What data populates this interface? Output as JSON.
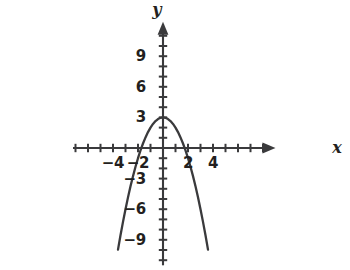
{
  "figure": {
    "background_color": "#ffffff",
    "ink_color": "#3a3a3c",
    "text_color": "#231f20",
    "width": 350,
    "height": 270
  },
  "axes": {
    "x_axis_label": "x",
    "y_axis_label": "y",
    "x_tick_labels": [
      {
        "text": "−4",
        "value": -4
      },
      {
        "text": "−2",
        "value": -2
      },
      {
        "text": "2",
        "value": 2
      },
      {
        "text": "4",
        "value": 4
      }
    ],
    "y_tick_labels": [
      {
        "text": "9",
        "value": 9
      },
      {
        "text": "6",
        "value": 6
      },
      {
        "text": "3",
        "value": 3
      },
      {
        "text": "−3",
        "value": -3
      },
      {
        "text": "−6",
        "value": -6
      },
      {
        "text": "−9",
        "value": -9
      }
    ]
  },
  "chart_data": {
    "type": "line",
    "title": "",
    "xlabel": "x",
    "ylabel": "y",
    "xlim": [
      -7.2,
      8.2
    ],
    "ylim": [
      -11.5,
      11.5
    ],
    "grid": false,
    "legend": false,
    "x_tick_step": 1,
    "y_tick_step": 1,
    "x_labeled_ticks": [
      -4,
      -2,
      2,
      4
    ],
    "y_labeled_ticks": [
      9,
      6,
      3,
      -3,
      -6,
      -9
    ],
    "series": [
      {
        "name": "y = 3 - x^2",
        "equation": "y = 3 − x²",
        "vertex": [
          0,
          3
        ],
        "x_intercepts": [
          -1.73,
          1.73
        ],
        "y_intercept": 3,
        "opens": "down",
        "x": [
          -3.6,
          -3.4,
          -3.2,
          -3.0,
          -2.8,
          -2.6,
          -2.4,
          -2.2,
          -2.0,
          -1.8,
          -1.6,
          -1.4,
          -1.2,
          -1.0,
          -0.8,
          -0.6,
          -0.4,
          -0.2,
          0.0,
          0.2,
          0.4,
          0.6,
          0.8,
          1.0,
          1.2,
          1.4,
          1.6,
          1.8,
          2.0,
          2.2,
          2.4,
          2.6,
          2.8,
          3.0,
          3.2,
          3.4,
          3.6
        ],
        "y": [
          -9.96,
          -8.56,
          -7.24,
          -6.0,
          -4.84,
          -3.76,
          -2.76,
          -1.84,
          -1.0,
          -0.24,
          0.44,
          1.04,
          1.56,
          2.0,
          2.36,
          2.64,
          2.84,
          2.96,
          3.0,
          2.96,
          2.84,
          2.64,
          2.36,
          2.0,
          1.56,
          1.04,
          0.44,
          -0.24,
          -1.0,
          -1.84,
          -2.76,
          -3.76,
          -4.84,
          -6.0,
          -7.24,
          -8.56,
          -9.96
        ]
      }
    ]
  }
}
